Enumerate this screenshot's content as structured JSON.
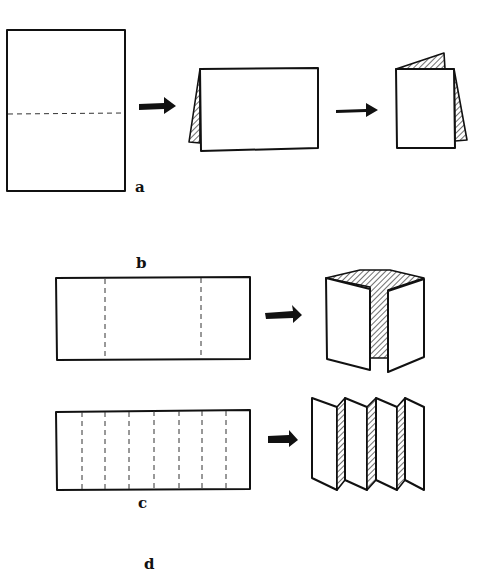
{
  "diagram": {
    "colors": {
      "ink": "#111111",
      "paper": "#ffffff",
      "fold_line": "#333333"
    },
    "rows": [
      {
        "id": "a",
        "label": "a",
        "description": "Single fold: sheet folded in half along a horizontal dashed fold line",
        "steps": [
          {
            "shape": "portrait-sheet",
            "fold_lines": 1,
            "orientation": "horizontal"
          },
          {
            "shape": "landscape-tent-card",
            "fold_lines": 0
          },
          {
            "shape": "portrait-folded-booklet",
            "fold_lines": 0
          }
        ]
      },
      {
        "id": "b",
        "label": "b",
        "description": "Gate fold: landscape sheet with two vertical dashed fold lines, folded into a gate",
        "steps": [
          {
            "shape": "landscape-sheet",
            "fold_lines": 2,
            "orientation": "vertical"
          },
          {
            "shape": "gate-fold",
            "fold_lines": 0
          }
        ]
      },
      {
        "id": "c",
        "label": "c",
        "description": "Accordion fold: landscape sheet with seven vertical dashed fold lines, folded into zig-zag panels",
        "steps": [
          {
            "shape": "landscape-sheet",
            "fold_lines": 7,
            "orientation": "vertical"
          },
          {
            "shape": "accordion-fold",
            "fold_lines": 0
          }
        ]
      },
      {
        "id": "d",
        "label": "d",
        "description": "Partially visible label at bottom edge",
        "steps": []
      }
    ],
    "arrows": 4
  }
}
